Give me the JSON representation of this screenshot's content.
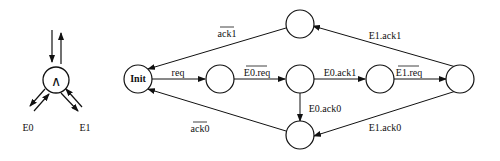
{
  "gate": {
    "symbol": "∧",
    "outputs": [
      "E0",
      "E1"
    ]
  },
  "states": {
    "init": "Init",
    "s1": "",
    "s2": "",
    "s3": "",
    "s4": "",
    "top": "",
    "bottom": ""
  },
  "transitions": {
    "req": "req",
    "e0_req": "E0.req",
    "e0_ack1": "E0.ack1",
    "e1_req": "E1.req",
    "e1_ack1": "E1.ack1",
    "ack1": "ack1",
    "e0_ack0": "E0.ack0",
    "e1_ack0": "E1.ack0",
    "ack0": "ack0"
  }
}
